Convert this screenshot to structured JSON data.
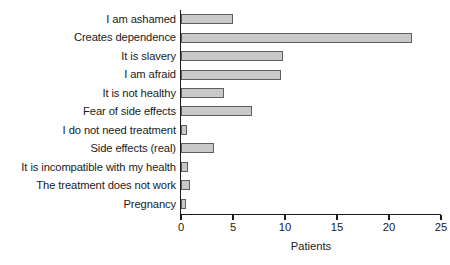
{
  "chart_data": {
    "type": "bar",
    "orientation": "horizontal",
    "title": "",
    "xlabel": "Patients",
    "ylabel": "",
    "xlim": [
      0,
      25
    ],
    "xticks": [
      0,
      5,
      10,
      15,
      20,
      25
    ],
    "grid": false,
    "legend": null,
    "bar_color": "#c9c9c9",
    "bar_edge_color": "#5e5e5e",
    "categories": [
      "I am ashamed",
      "Creates dependence",
      "It is slavery",
      "I am afraid",
      "It is not healthy",
      "Fear of side effects",
      "I do not need treatment",
      "Side effects (real)",
      "It is incompatible with my health",
      "The treatment does not work",
      "Pregnancy"
    ],
    "values": [
      5,
      22.2,
      9.8,
      9.6,
      4.1,
      6.8,
      0.6,
      3.2,
      0.7,
      0.9,
      0.5
    ]
  }
}
